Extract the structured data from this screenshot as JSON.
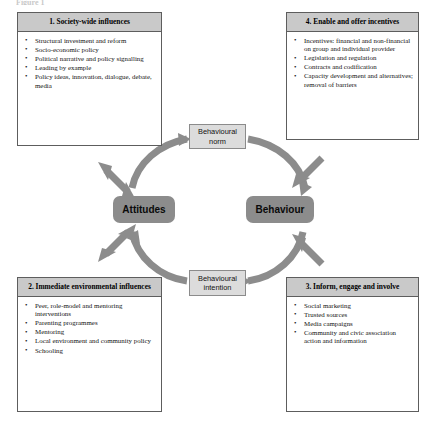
{
  "figure": {
    "top_caption_fragment": "Figure 1",
    "cycle_nodes": {
      "norm": "Behavioural\nnorm",
      "norm_line1": "Behavioural",
      "norm_line2": "norm",
      "attitudes": "Attitudes",
      "behaviour": "Behaviour",
      "intention_line1": "Behavioural",
      "intention_line2": "intention"
    }
  },
  "panels": [
    {
      "id": "panel1",
      "position": "top-left",
      "title": "1. Society-wide influences",
      "items": [
        "Structural investment and reform",
        "Socio-economic policy",
        "Political narrative and policy signalling",
        "Leading by example",
        "Policy ideas, innovation, dialogue, debate, media"
      ]
    },
    {
      "id": "panel4",
      "position": "top-right",
      "title": "4. Enable and offer incentives",
      "items": [
        "Incentives: financial and non-financial on group and individual provider",
        "Legislation and regulation",
        "Contracts and codification",
        "Capacity development and alternatives; removal of barriers"
      ]
    },
    {
      "id": "panel2",
      "position": "bottom-left",
      "title": "2. Immediate environmental influences",
      "items": [
        "Peer, role-model and mentoring interventions",
        "Parenting programmes",
        "Mentoring",
        "Local environment and community policy",
        "Schooling"
      ]
    },
    {
      "id": "panel3",
      "position": "bottom-right",
      "title": "3. Inform, engage and involve",
      "items": [
        "Social marketing",
        "Trusted sources",
        "Media campaigns",
        "Community and civic association action and information"
      ]
    }
  ],
  "connectors": {
    "cycle_direction": "clockwise: Behavioural norm to Behaviour to Behavioural intention to Attitudes to Behavioural norm",
    "diagonal_arrows": [
      {
        "from": "1. Society-wide influences",
        "to": "Attitudes",
        "heads": "double"
      },
      {
        "from": "2. Immediate environmental influences",
        "to": "Attitudes",
        "heads": "double"
      },
      {
        "from": "4. Enable and offer incentives",
        "to": "Behaviour",
        "heads": "single"
      },
      {
        "from": "3. Inform, engage and involve",
        "to": "Behaviour",
        "heads": "single"
      }
    ]
  },
  "colors": {
    "panel_header_fill": "#c9c9c9",
    "panel_border": "#5d5d5d",
    "major_node_fill": "#8c8c8c",
    "minor_node_fill": "#dcdcdc",
    "arrow_fill": "#8c8c8c",
    "background": "#ffffff"
  }
}
